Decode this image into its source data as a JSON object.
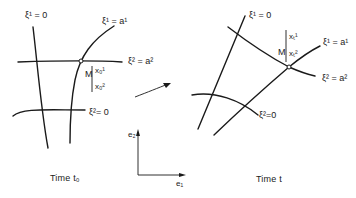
{
  "left_panel": {
    "caption": "Time t₀",
    "labels": {
      "xi1_zero": "ξ¹ = 0",
      "xi1_a1": "ξ¹ = a¹",
      "xi2_a2": "ξ² = a²",
      "xi2_zero": "ξ²= 0",
      "point": "M",
      "coord1": "x₀¹",
      "coord2": "x₀²"
    }
  },
  "right_panel": {
    "caption": "Time t",
    "labels": {
      "xi1_zero": "ξ¹ = 0",
      "xi1_a1": "ξ¹ = a¹",
      "xi2_a2": "ξ² = a²",
      "xi2_zero": "ξ²=0",
      "point": "M",
      "coord1": "xₜ¹",
      "coord2": "xₜ²"
    }
  },
  "axes": {
    "e1": "e₁",
    "e2": "e₂"
  },
  "transform_arrow": "arrow-right-icon"
}
